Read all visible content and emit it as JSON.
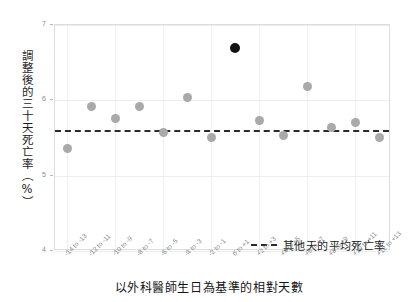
{
  "chart_data": {
    "type": "scatter",
    "title": "",
    "xlabel": "以外科醫師生日為基準的相對天數",
    "ylabel": "調整後的三十天死亡率（%）",
    "ylim": [
      4,
      7
    ],
    "yticks": [
      "4",
      "5",
      "6",
      "7"
    ],
    "grid": true,
    "categories": [
      "-14 to -13",
      "-12 to -11",
      "-10 to -9",
      "-8 to -7",
      "-6 to -5",
      "-4 to -3",
      "-2 to -1",
      "0 to +1",
      "+2 to +3",
      "+4 to +5",
      "+6 to +7",
      "+8 to +9",
      "+10 to +11",
      "+12 to +13"
    ],
    "values": [
      5.36,
      5.92,
      5.76,
      5.92,
      5.57,
      6.04,
      5.51,
      6.69,
      5.73,
      5.53,
      6.18,
      5.64,
      5.7,
      5.51
    ],
    "highlight_index": 7,
    "point_color": "#a9a9a9",
    "highlight_color": "#111111",
    "reference_line": {
      "value": 5.61,
      "label": "其他天的平均死亡率",
      "color": "#2b2b2b",
      "style": "dashed"
    },
    "legend": {
      "position": "inside-bottom-right",
      "entries": [
        {
          "label": "其他天的平均死亡率",
          "marker": "dashed-line",
          "color": "#2b2b2b"
        }
      ]
    }
  }
}
